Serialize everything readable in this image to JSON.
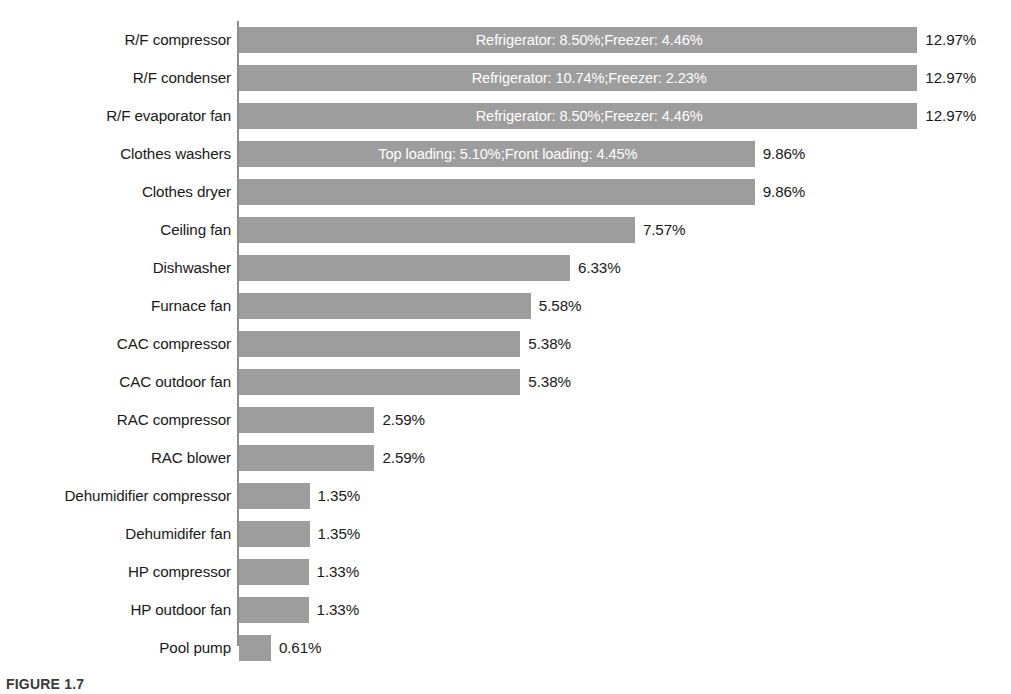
{
  "figure": {
    "caption": "FIGURE 1.7"
  },
  "chart_data": {
    "type": "bar",
    "orientation": "horizontal",
    "title": "",
    "xlabel": "",
    "ylabel": "",
    "grid": false,
    "legend": "none",
    "xlim": [
      0,
      12.97
    ],
    "value_suffix": "%",
    "bar_color": "#9d9d9d",
    "inner_label_color": "#ffffff",
    "value_label_color": "#191919",
    "axis_color": "#8d8d8d",
    "categories": [
      "R/F compressor",
      "R/F condenser",
      "R/F evaporator fan",
      "Clothes washers",
      "Clothes dryer",
      "Ceiling fan",
      "Dishwasher",
      "Furnace fan",
      "CAC compressor",
      "CAC outdoor fan",
      "RAC compressor",
      "RAC blower",
      "Dehumidifier compressor",
      "Dehumidifer fan",
      "HP compressor",
      "HP outdoor fan",
      "Pool pump"
    ],
    "values": [
      12.97,
      12.97,
      12.97,
      9.86,
      9.86,
      7.57,
      6.33,
      5.58,
      5.38,
      5.38,
      2.59,
      2.59,
      1.35,
      1.35,
      1.33,
      1.33,
      0.61
    ],
    "value_labels": [
      "12.97%",
      "12.97%",
      "12.97%",
      "9.86%",
      "9.86%",
      "7.57%",
      "6.33%",
      "5.58%",
      "5.38%",
      "5.38%",
      "2.59%",
      "2.59%",
      "1.35%",
      "1.35%",
      "1.33%",
      "1.33%",
      "0.61%"
    ],
    "inner_labels": [
      "Refrigerator: 8.50%;Freezer: 4.46%",
      "Refrigerator: 10.74%;Freezer: 2.23%",
      "Refrigerator: 8.50%;Freezer: 4.46%",
      "Top loading: 5.10%;Front loading: 4.45%",
      "",
      "",
      "",
      "",
      "",
      "",
      "",
      "",
      "",
      "",
      "",
      "",
      ""
    ],
    "breakdowns": [
      {
        "category": "R/F compressor",
        "parts": [
          {
            "name": "Refrigerator",
            "value": 8.5
          },
          {
            "name": "Freezer",
            "value": 4.46
          }
        ]
      },
      {
        "category": "R/F condenser",
        "parts": [
          {
            "name": "Refrigerator",
            "value": 10.74
          },
          {
            "name": "Freezer",
            "value": 2.23
          }
        ]
      },
      {
        "category": "R/F evaporator fan",
        "parts": [
          {
            "name": "Refrigerator",
            "value": 8.5
          },
          {
            "name": "Freezer",
            "value": 4.46
          }
        ]
      },
      {
        "category": "Clothes washers",
        "parts": [
          {
            "name": "Top loading",
            "value": 5.1
          },
          {
            "name": "Front loading",
            "value": 4.45
          }
        ]
      }
    ]
  }
}
